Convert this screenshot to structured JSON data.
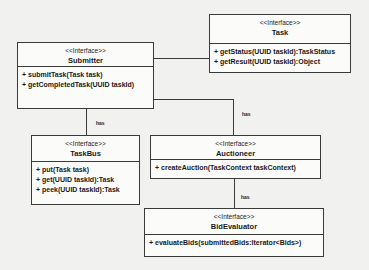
{
  "diagram": {
    "type": "UML class diagram",
    "stereotype": "<<Interface>>",
    "classes": [
      {
        "id": "submitter",
        "name": "Submitter",
        "operations": [
          "+ submitTask(Task task)",
          "+ getCompletedTask(UUID taskId)"
        ]
      },
      {
        "id": "task",
        "name": "Task",
        "operations": [
          "+ getStatus(UUID taskId):TaskStatus",
          "+ getResult(UUID taskId):Object"
        ]
      },
      {
        "id": "taskbus",
        "name": "TaskBus",
        "operations": [
          "+ put(Task task)",
          "+ get(UUID taskId):Task",
          "+ peek(UUID taskId):Task"
        ]
      },
      {
        "id": "auctioneer",
        "name": "Auctioneer",
        "operations": [
          "+ createAuction(TaskContext taskContext)"
        ]
      },
      {
        "id": "bidevaluator",
        "name": "BidEvaluator",
        "operations": [
          "+ evaluateBids(submittedBids:Iterator<Bids>)"
        ]
      }
    ],
    "relations": [
      {
        "from": "submitter",
        "to": "task",
        "label": ""
      },
      {
        "from": "submitter",
        "to": "taskbus",
        "label": "has"
      },
      {
        "from": "submitter",
        "to": "auctioneer",
        "label": "has"
      },
      {
        "from": "auctioneer",
        "to": "bidevaluator",
        "label": "has"
      }
    ]
  }
}
